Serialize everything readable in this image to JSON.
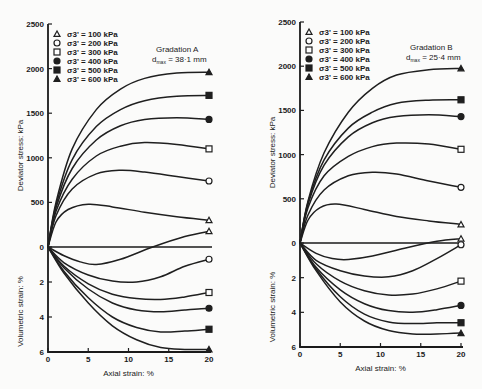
{
  "chart_data": [
    {
      "type": "line",
      "panel": "left",
      "annotation": {
        "line1": "Gradation A",
        "line2_prefix": "d",
        "line2_sub": "max",
        "line2_suffix": " = 38·1 mm"
      },
      "xlabel": "Axial strain: %",
      "ylabel_top": "Deviator stress: kPa",
      "ylabel_bottom": "Volumetric strain: %",
      "x_ticks": [
        0,
        5,
        10,
        15,
        20
      ],
      "y_top_ticks": [
        0,
        500,
        1000,
        1500,
        2000,
        2500
      ],
      "y_bottom_ticks": [
        0,
        2,
        4,
        6
      ],
      "xlim": [
        0,
        20
      ],
      "ylim_top": [
        0,
        2500
      ],
      "ylim_bottom": [
        0,
        6
      ],
      "legend": [
        {
          "marker": "triangle-open",
          "label": "σ3' = 100 kPa"
        },
        {
          "marker": "circle-open",
          "label": "σ3' = 200 kPa"
        },
        {
          "marker": "square-open",
          "label": "σ3' = 300 kPa"
        },
        {
          "marker": "circle-filled",
          "label": "σ3' = 400 kPa"
        },
        {
          "marker": "square-filled",
          "label": "σ3' = 500 kPa"
        },
        {
          "marker": "triangle-filled",
          "label": "σ3' = 600 kPa"
        }
      ],
      "series_stress": [
        {
          "name": "100 kPa",
          "marker": "triangle-open",
          "x": [
            0,
            1,
            2.5,
            5,
            8,
            12,
            16,
            20
          ],
          "y": [
            0,
            280,
            420,
            480,
            450,
            390,
            340,
            300
          ]
        },
        {
          "name": "200 kPa",
          "marker": "circle-open",
          "x": [
            0,
            1,
            3,
            6,
            9,
            12,
            16,
            20
          ],
          "y": [
            0,
            350,
            650,
            820,
            860,
            840,
            790,
            740
          ]
        },
        {
          "name": "300 kPa",
          "marker": "square-open",
          "x": [
            0,
            1,
            3,
            6,
            9,
            12,
            16,
            20
          ],
          "y": [
            0,
            400,
            760,
            1020,
            1130,
            1170,
            1150,
            1100
          ]
        },
        {
          "name": "400 kPa",
          "marker": "circle-filled",
          "x": [
            0,
            1,
            3,
            6,
            9,
            12,
            16,
            20
          ],
          "y": [
            0,
            440,
            880,
            1200,
            1360,
            1430,
            1450,
            1430
          ]
        },
        {
          "name": "500 kPa",
          "marker": "square-filled",
          "x": [
            0,
            1,
            3,
            6,
            9,
            12,
            16,
            20
          ],
          "y": [
            0,
            470,
            980,
            1350,
            1540,
            1640,
            1690,
            1700
          ]
        },
        {
          "name": "600 kPa",
          "marker": "triangle-filled",
          "x": [
            0,
            1,
            3,
            6,
            9,
            12,
            16,
            20
          ],
          "y": [
            0,
            500,
            1100,
            1540,
            1770,
            1890,
            1950,
            1960
          ]
        }
      ],
      "series_volumetric": [
        {
          "name": "100 kPa",
          "marker": "triangle-open",
          "x": [
            0,
            2,
            4,
            6,
            9,
            13,
            17,
            20
          ],
          "y": [
            0,
            0.5,
            0.85,
            1.0,
            0.7,
            0.0,
            -0.6,
            -0.9
          ]
        },
        {
          "name": "200 kPa",
          "marker": "circle-open",
          "x": [
            0,
            2,
            5,
            8,
            11,
            14,
            17,
            20
          ],
          "y": [
            0,
            0.9,
            1.6,
            1.95,
            2.0,
            1.7,
            1.1,
            0.7
          ]
        },
        {
          "name": "300 kPa",
          "marker": "square-open",
          "x": [
            0,
            2,
            5,
            8,
            11,
            14,
            17,
            20
          ],
          "y": [
            0,
            1.1,
            2.1,
            2.7,
            2.95,
            3.0,
            2.85,
            2.6
          ]
        },
        {
          "name": "400 kPa",
          "marker": "circle-filled",
          "x": [
            0,
            2,
            5,
            8,
            11,
            14,
            17,
            20
          ],
          "y": [
            0,
            1.2,
            2.4,
            3.2,
            3.6,
            3.7,
            3.6,
            3.5
          ]
        },
        {
          "name": "500 kPa",
          "marker": "square-filled",
          "x": [
            0,
            2,
            5,
            8,
            11,
            14,
            17,
            20
          ],
          "y": [
            0,
            1.4,
            2.9,
            4.0,
            4.6,
            4.85,
            4.8,
            4.7
          ]
        },
        {
          "name": "600 kPa",
          "marker": "triangle-filled",
          "x": [
            0,
            2,
            5,
            8,
            11,
            14,
            17,
            20
          ],
          "y": [
            0,
            1.5,
            3.2,
            4.5,
            5.3,
            5.75,
            5.85,
            5.85
          ]
        }
      ]
    },
    {
      "type": "line",
      "panel": "right",
      "annotation": {
        "line1": "Gradation B",
        "line2_prefix": "d",
        "line2_sub": "max",
        "line2_suffix": " = 25·4 mm"
      },
      "xlabel": "Axial strain: %",
      "ylabel_top": "Deviator stress: kPa",
      "ylabel_bottom": "Volumetric strain: %",
      "x_ticks": [
        0,
        5,
        10,
        15,
        20
      ],
      "y_top_ticks": [
        0,
        500,
        1000,
        1500,
        2000,
        2500
      ],
      "y_bottom_ticks": [
        0,
        2,
        4,
        6
      ],
      "xlim": [
        0,
        20
      ],
      "ylim_top": [
        0,
        2500
      ],
      "ylim_bottom": [
        0,
        6
      ],
      "legend": [
        {
          "marker": "triangle-open",
          "label": "σ3' = 100 kPa"
        },
        {
          "marker": "circle-open",
          "label": "σ3' = 200 kPa"
        },
        {
          "marker": "square-open",
          "label": "σ3' = 300 kPa"
        },
        {
          "marker": "circle-filled",
          "label": "σ3' = 400 kPa"
        },
        {
          "marker": "square-filled",
          "label": "σ3' = 500 kPa"
        },
        {
          "marker": "triangle-filled",
          "label": "σ3' = 600 kPa"
        }
      ],
      "series_stress": [
        {
          "name": "100 kPa",
          "marker": "triangle-open",
          "x": [
            0,
            1,
            2.5,
            4.5,
            8,
            12,
            16,
            20
          ],
          "y": [
            0,
            260,
            400,
            440,
            380,
            300,
            250,
            210
          ]
        },
        {
          "name": "200 kPa",
          "marker": "circle-open",
          "x": [
            0,
            1,
            3,
            6,
            9,
            12,
            16,
            20
          ],
          "y": [
            0,
            320,
            600,
            760,
            800,
            780,
            700,
            630
          ]
        },
        {
          "name": "300 kPa",
          "marker": "square-open",
          "x": [
            0,
            1,
            3,
            6,
            9,
            12,
            16,
            20
          ],
          "y": [
            0,
            400,
            760,
            980,
            1090,
            1130,
            1120,
            1060
          ]
        },
        {
          "name": "400 kPa",
          "marker": "circle-filled",
          "x": [
            0,
            1,
            3,
            6,
            9,
            12,
            16,
            20
          ],
          "y": [
            0,
            440,
            880,
            1200,
            1360,
            1430,
            1450,
            1430
          ]
        },
        {
          "name": "500 kPa",
          "marker": "square-filled",
          "x": [
            0,
            1,
            3,
            6,
            9,
            12,
            16,
            20
          ],
          "y": [
            0,
            460,
            940,
            1300,
            1480,
            1580,
            1615,
            1620
          ]
        },
        {
          "name": "600 kPa",
          "marker": "triangle-filled",
          "x": [
            0,
            1,
            3,
            6,
            9,
            12,
            16,
            20
          ],
          "y": [
            0,
            480,
            1020,
            1480,
            1750,
            1900,
            1960,
            1975
          ]
        }
      ],
      "series_volumetric": [
        {
          "name": "100 kPa",
          "marker": "triangle-open",
          "x": [
            0,
            2,
            4,
            6,
            9,
            13,
            17,
            20
          ],
          "y": [
            0,
            0.6,
            0.9,
            0.95,
            0.75,
            0.3,
            -0.1,
            -0.25
          ]
        },
        {
          "name": "200 kPa",
          "marker": "circle-open",
          "x": [
            0,
            2,
            5,
            8,
            11,
            14,
            17,
            20
          ],
          "y": [
            0,
            1.0,
            1.6,
            1.9,
            1.95,
            1.6,
            0.9,
            0.1
          ]
        },
        {
          "name": "300 kPa",
          "marker": "square-open",
          "x": [
            0,
            2,
            5,
            8,
            11,
            14,
            17,
            20
          ],
          "y": [
            0,
            1.2,
            2.2,
            2.75,
            3.0,
            2.95,
            2.65,
            2.2
          ]
        },
        {
          "name": "400 kPa",
          "marker": "circle-filled",
          "x": [
            0,
            2,
            5,
            8,
            11,
            14,
            17,
            20
          ],
          "y": [
            0,
            1.4,
            2.7,
            3.5,
            3.9,
            4.0,
            3.85,
            3.6
          ]
        },
        {
          "name": "500 kPa",
          "marker": "square-filled",
          "x": [
            0,
            2,
            5,
            8,
            11,
            14,
            17,
            20
          ],
          "y": [
            0,
            1.5,
            3.1,
            4.1,
            4.55,
            4.65,
            4.6,
            4.6
          ]
        },
        {
          "name": "600 kPa",
          "marker": "triangle-filled",
          "x": [
            0,
            2,
            5,
            8,
            11,
            14,
            17,
            20
          ],
          "y": [
            0,
            1.6,
            3.4,
            4.5,
            5.05,
            5.25,
            5.25,
            5.2
          ]
        }
      ]
    }
  ],
  "layout": {
    "panels": [
      {
        "x0": 48,
        "x20": 209,
        "y_top_0": 247,
        "y_top_2500": 24,
        "y_bot_0": 247,
        "y_bot_6": 352,
        "legend_x": 57,
        "legend_y": 34,
        "annot_x": 156,
        "annot_y": 52
      },
      {
        "x0": 300,
        "x20": 461,
        "y_top_0": 243,
        "y_top_2500": 22,
        "y_bot_0": 243,
        "y_bot_6": 347,
        "legend_x": 309,
        "legend_y": 32,
        "annot_x": 410,
        "annot_y": 50
      }
    ],
    "ink": "#1f1f1f"
  }
}
